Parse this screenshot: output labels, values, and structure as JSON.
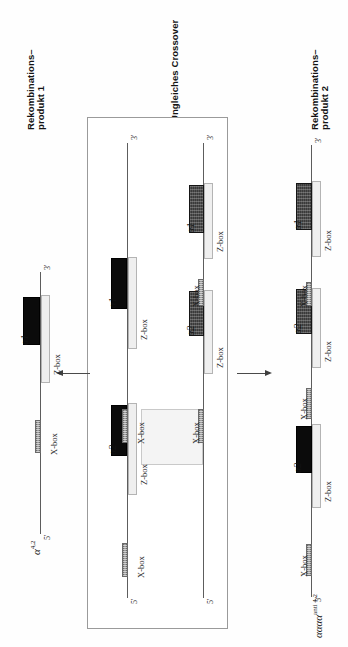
{
  "figure": {
    "type": "diagram",
    "orientation": "rotated-90-ccw"
  },
  "headings": {
    "left": {
      "line1": "Rekombinations–",
      "line2": "produkt 1"
    },
    "center": "Ungleiches Crossover",
    "right": {
      "line1": "Rekombinations–",
      "line2": "produkt 2"
    }
  },
  "allele_labels": {
    "left": {
      "symbol": "α",
      "superscript": "4,2"
    },
    "right": {
      "symbol": "αααα",
      "superscript": "anti 4,2"
    }
  },
  "ends": {
    "five": "5'",
    "three": "3'"
  },
  "box_labels": {
    "zbox": "Z-box",
    "xbox": "X-box"
  },
  "genes": {
    "a1": "α1",
    "a2": "α2"
  },
  "colors": {
    "alpha_black": "#0b0b0b",
    "alpha_dark": "#3a3a3a",
    "zbox": "#efefef",
    "xbox": "#9b9b9b",
    "chromosome": "#5d5d5d",
    "panel_border": "#9a9a9a",
    "crossover_region": "#f4f4f4"
  },
  "panels": {
    "center": {
      "title": "Ungleiches Crossover",
      "chromosomes": [
        {
          "name": "chromosome-upper",
          "five_end": "5'",
          "three_end": "3'",
          "elements": [
            {
              "kind": "xbox",
              "label": "X-box"
            },
            {
              "kind": "zbox",
              "label": "Z-box"
            },
            {
              "kind": "gene",
              "label": "α2",
              "fill": "alpha_black"
            },
            {
              "kind": "xbox",
              "label": "X-box"
            },
            {
              "kind": "zbox",
              "label": "Z-box"
            },
            {
              "kind": "gene",
              "label": "α1",
              "fill": "alpha_black"
            }
          ]
        },
        {
          "name": "chromosome-lower",
          "five_end": "5'",
          "three_end": "3'",
          "elements": [
            {
              "kind": "xbox",
              "label": "X-box"
            },
            {
              "kind": "zbox",
              "label": "Z-box"
            },
            {
              "kind": "gene",
              "label": "α2",
              "fill": "alpha_dark"
            },
            {
              "kind": "xbox",
              "label": "X-box"
            },
            {
              "kind": "zbox",
              "label": "Z-box"
            },
            {
              "kind": "gene",
              "label": "α1",
              "fill": "alpha_dark"
            }
          ]
        }
      ],
      "crossover_note": "Ungleiche Paarung der X-Boxen"
    },
    "product1": {
      "name": "Rekombinationsprodukt 1",
      "allele": "α 4,2",
      "five_end": "5'",
      "three_end": "3'",
      "elements": [
        {
          "kind": "xbox",
          "label": "X-box"
        },
        {
          "kind": "zbox",
          "label": "Z-box"
        },
        {
          "kind": "gene",
          "label": "α1",
          "fill": "alpha_black"
        }
      ]
    },
    "product2": {
      "name": "Rekombinationsprodukt 2",
      "allele": "αααα anti 4,2",
      "five_end": "5'",
      "three_end": "3'",
      "elements": [
        {
          "kind": "xbox",
          "label": "X-box"
        },
        {
          "kind": "zbox",
          "label": "Z-box"
        },
        {
          "kind": "gene",
          "label": "α2",
          "fill": "alpha_black"
        },
        {
          "kind": "xbox",
          "label": "X-box"
        },
        {
          "kind": "zbox",
          "label": "Z-box"
        },
        {
          "kind": "gene",
          "label": "α2",
          "fill": "alpha_dark"
        },
        {
          "kind": "xbox",
          "label": "X-box"
        },
        {
          "kind": "zbox",
          "label": "Z-box"
        },
        {
          "kind": "gene",
          "label": "α1",
          "fill": "alpha_dark"
        }
      ]
    }
  }
}
